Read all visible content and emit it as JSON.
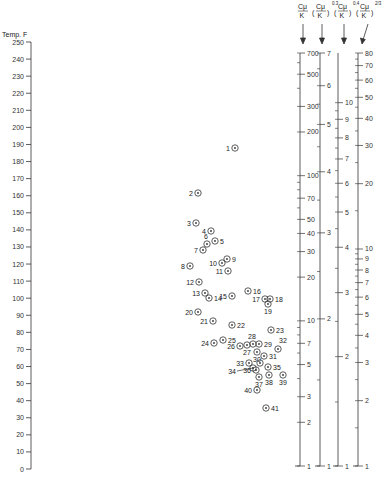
{
  "chart_data": {
    "type": "scatter",
    "title": "",
    "left_axis": {
      "label": "Temp. F",
      "min": 0,
      "max": 250,
      "step": 10,
      "ticks": [
        0,
        10,
        20,
        30,
        40,
        50,
        60,
        70,
        80,
        90,
        100,
        110,
        120,
        130,
        140,
        150,
        160,
        170,
        180,
        190,
        200,
        210,
        220,
        230,
        240,
        250
      ]
    },
    "right_scales": [
      {
        "name": "Cp/K",
        "header": "Cμ/K",
        "exponent": "",
        "min": 1,
        "max": 700,
        "labels": [
          700,
          500,
          300,
          200,
          100,
          70,
          50,
          40,
          30,
          20,
          10,
          7,
          5,
          3,
          2,
          1
        ]
      },
      {
        "name": "(Cp/K)^0.3",
        "header": "(Cμ/K)",
        "exponent": "0.3",
        "min": 1,
        "max": 7,
        "labels": [
          7,
          6,
          5,
          4,
          3,
          2,
          1
        ]
      },
      {
        "name": "(Cp/K)^0.4",
        "header": "(Cμ/K)",
        "exponent": "0.4",
        "min": 1,
        "max": 13.7,
        "labels": [
          10,
          9,
          8,
          7,
          6,
          5,
          4,
          3,
          2,
          1
        ]
      },
      {
        "name": "(Cp/K)^(2/3)",
        "header": "(Cμ/K)",
        "exponent": "2/3",
        "min": 1,
        "max": 80,
        "labels": [
          80,
          70,
          60,
          50,
          40,
          30,
          20,
          10,
          9,
          8,
          7,
          6,
          5,
          4,
          3,
          2,
          1
        ]
      }
    ],
    "points": [
      {
        "id": "1",
        "x": 235,
        "y": 148
      },
      {
        "id": "2",
        "x": 198,
        "y": 193
      },
      {
        "id": "3",
        "x": 196,
        "y": 223
      },
      {
        "id": "4",
        "x": 211,
        "y": 231
      },
      {
        "id": "5",
        "x": 215,
        "y": 241
      },
      {
        "id": "6",
        "x": 207,
        "y": 244
      },
      {
        "id": "7",
        "x": 203,
        "y": 250
      },
      {
        "id": "8",
        "x": 190,
        "y": 266
      },
      {
        "id": "9",
        "x": 227,
        "y": 259
      },
      {
        "id": "10",
        "x": 222,
        "y": 263
      },
      {
        "id": "11",
        "x": 228,
        "y": 271
      },
      {
        "id": "12",
        "x": 199,
        "y": 282
      },
      {
        "id": "13",
        "x": 205,
        "y": 293
      },
      {
        "id": "14",
        "x": 209,
        "y": 298
      },
      {
        "id": "15",
        "x": 232,
        "y": 296
      },
      {
        "id": "16",
        "x": 248,
        "y": 291
      },
      {
        "id": "17",
        "x": 265,
        "y": 299
      },
      {
        "id": "18",
        "x": 270,
        "y": 299
      },
      {
        "id": "19",
        "x": 268,
        "y": 304
      },
      {
        "id": "20",
        "x": 198,
        "y": 312
      },
      {
        "id": "21",
        "x": 213,
        "y": 321
      },
      {
        "id": "22",
        "x": 232,
        "y": 325
      },
      {
        "id": "23",
        "x": 271,
        "y": 330
      },
      {
        "id": "24",
        "x": 214,
        "y": 343
      },
      {
        "id": "25",
        "x": 223,
        "y": 340
      },
      {
        "id": "26",
        "x": 240,
        "y": 346
      },
      {
        "id": "27",
        "x": 247,
        "y": 345
      },
      {
        "id": "28",
        "x": 253,
        "y": 344
      },
      {
        "id": "29",
        "x": 259,
        "y": 344
      },
      {
        "id": "30",
        "x": 257,
        "y": 352
      },
      {
        "id": "31",
        "x": 264,
        "y": 356
      },
      {
        "id": "32",
        "x": 278,
        "y": 349
      },
      {
        "id": "33",
        "x": 249,
        "y": 363
      },
      {
        "id": "",
        "x": 260,
        "y": 363
      },
      {
        "id": "34",
        "x": 253,
        "y": 368
      },
      {
        "id": "35",
        "x": 268,
        "y": 367
      },
      {
        "id": "36",
        "x": 256,
        "y": 370
      },
      {
        "id": "37",
        "x": 259,
        "y": 377
      },
      {
        "id": "38",
        "x": 269,
        "y": 375
      },
      {
        "id": "39",
        "x": 283,
        "y": 375
      },
      {
        "id": "40",
        "x": 257,
        "y": 390
      },
      {
        "id": "41",
        "x": 266,
        "y": 408
      }
    ],
    "xlabel": "",
    "ylabel": "Temp. F",
    "ylim": [
      0,
      250
    ],
    "grid": false,
    "legend": "none"
  },
  "axis": {
    "temp_label": "Temp. F"
  },
  "headers": {
    "h1_num": "Cμ",
    "h1_den": "K",
    "h2_num": "Cμ",
    "h2_den": "K",
    "h2_exp": "0.3",
    "h3_num": "Cμ",
    "h3_den": "K",
    "h3_exp": "0.4",
    "h4_num": "Cμ",
    "h4_den": "K",
    "h4_exp": "2/3"
  },
  "colors": {
    "ink": "#333333",
    "background": "#ffffff"
  }
}
